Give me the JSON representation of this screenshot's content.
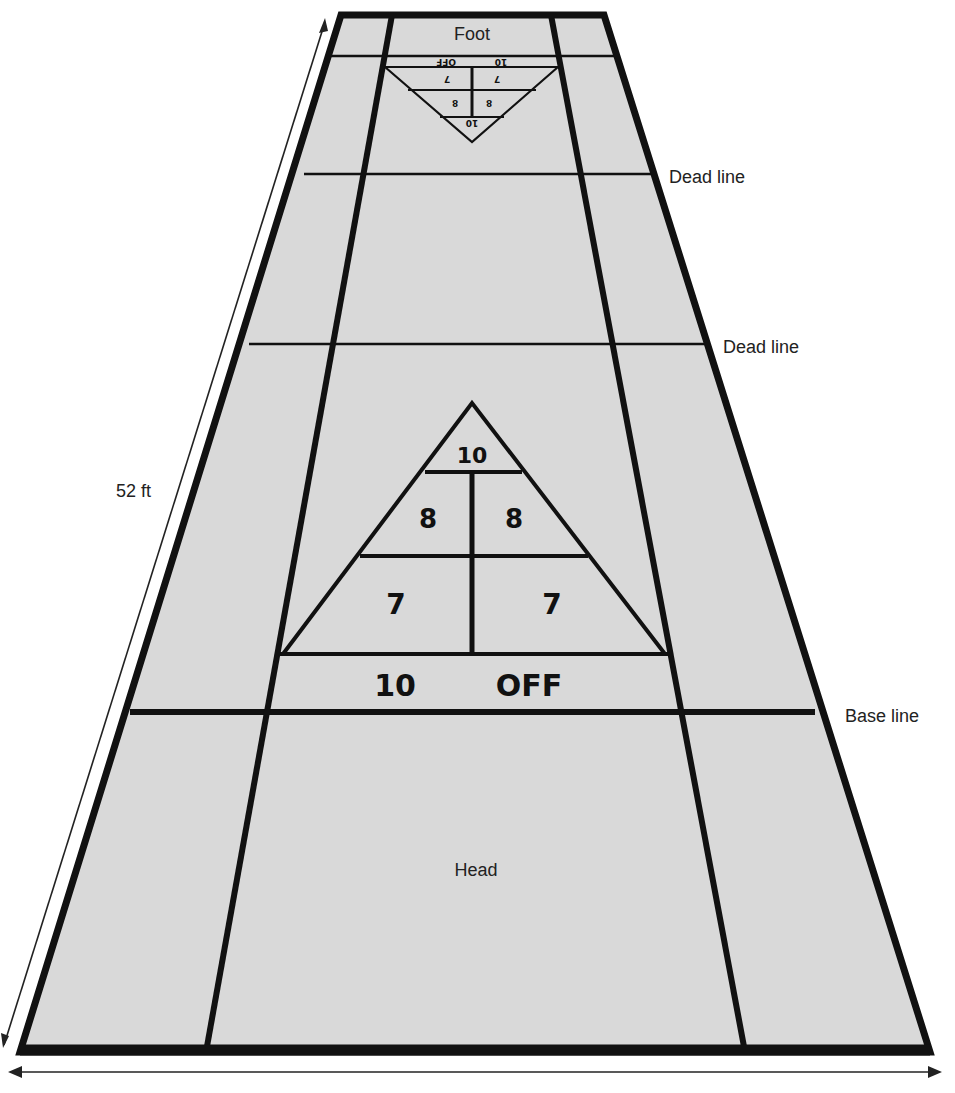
{
  "diagram": {
    "colors": {
      "court": "#d9d9d9",
      "lines": "#111111",
      "background": "#ffffff"
    },
    "labels": {
      "foot": "Foot",
      "head": "Head",
      "dead_line_1": "Dead line",
      "dead_line_2": "Dead line",
      "base_line": "Base line",
      "length": "52 ft"
    },
    "far_triangle": {
      "orientation": "inverted",
      "band": {
        "left": "10",
        "right": "OFF"
      },
      "row_7": [
        "7",
        "7"
      ],
      "row_8": [
        "8",
        "8"
      ],
      "tip": "10"
    },
    "near_triangle": {
      "tip": "10",
      "row_8": [
        "8",
        "8"
      ],
      "row_7": [
        "7",
        "7"
      ],
      "band_left": "10",
      "band_right": "OFF"
    },
    "dimension_arrows": [
      "length-arrow",
      "width-arrow"
    ]
  }
}
